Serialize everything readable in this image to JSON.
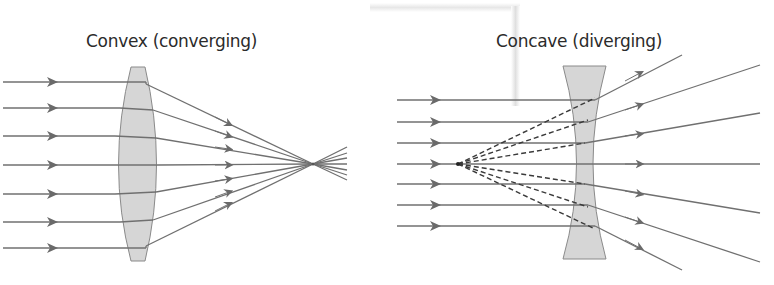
{
  "diagrams": {
    "convex": {
      "title": "Convex (converging)",
      "lens_type": "convex",
      "behavior": "converging",
      "ray_count": 7,
      "focal_point": "real"
    },
    "concave": {
      "title": "Concave (diverging)",
      "lens_type": "concave",
      "behavior": "diverging",
      "ray_count": 7,
      "focal_point": "virtual",
      "virtual_rays_style": "dashed"
    }
  },
  "colors": {
    "ray": "#6e6e6e",
    "arrow": "#6a6a6a",
    "lens_fill": "#d4d4d4",
    "lens_stroke": "#8a8a8a",
    "dashed": "#3a3a3a",
    "text": "#2b2b2b"
  }
}
